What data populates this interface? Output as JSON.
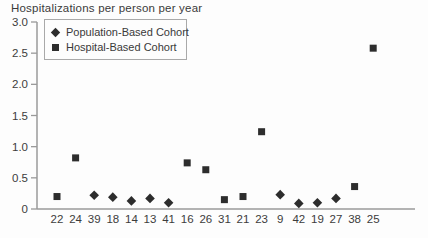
{
  "chart": {
    "title": "Hospitalizations per person per year",
    "legend": [
      {
        "marker": "diamond",
        "label": "Population-Based Cohort"
      },
      {
        "marker": "square",
        "label": "Hospital-Based Cohort"
      }
    ]
  },
  "chart_data": {
    "type": "scatter",
    "title": "Hospitalizations per person per year",
    "xlabel": "",
    "ylabel": "",
    "ylim": [
      0,
      3.0
    ],
    "grid": false,
    "legend_position": "top-left",
    "marker_color": "#2d2d2d",
    "axis_color": "#9a9a9a",
    "label_color": "#3c3c3c",
    "yticks": [
      {
        "v": 3.0,
        "label": "3.0"
      },
      {
        "v": 2.5,
        "label": "2.5"
      },
      {
        "v": 2.0,
        "label": "2.0"
      },
      {
        "v": 1.5,
        "label": "1.5"
      },
      {
        "v": 1.0,
        "label": "1.0"
      },
      {
        "v": 0.5,
        "label": "0.5"
      },
      {
        "v": 0.0,
        "label": "0"
      }
    ],
    "categories": [
      "22",
      "24",
      "39",
      "18",
      "14",
      "13",
      "41",
      "16",
      "26",
      "31",
      "21",
      "23",
      "9",
      "42",
      "19",
      "27",
      "38",
      "25"
    ],
    "series": [
      {
        "name": "Population-Based Cohort",
        "marker": "diamond",
        "values": [
          null,
          null,
          0.22,
          0.19,
          0.13,
          0.17,
          0.1,
          null,
          null,
          null,
          null,
          null,
          0.23,
          0.09,
          0.1,
          0.17,
          null,
          null
        ]
      },
      {
        "name": "Hospital-Based Cohort",
        "marker": "square",
        "values": [
          0.2,
          0.82,
          null,
          null,
          null,
          null,
          null,
          0.74,
          0.63,
          0.15,
          0.2,
          1.24,
          null,
          null,
          null,
          null,
          0.36,
          2.58
        ]
      }
    ]
  }
}
